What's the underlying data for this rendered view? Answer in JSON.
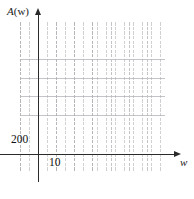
{
  "figure": {
    "name": "blank-coordinate-grid",
    "background_color": "#ffffff",
    "axis_color": "#2a2a2a",
    "major_grid_color": "#c4c4c8",
    "minor_grid_color": "#aaaaaf"
  },
  "axes": {
    "y_label_prefix": "A",
    "y_label_suffix": "(w)",
    "y_label_full": "A(w)",
    "x_label": "w"
  },
  "ticks": {
    "y": [
      {
        "label": "200",
        "value": 200
      }
    ],
    "x": [
      {
        "label": "10",
        "value": 10
      }
    ]
  },
  "chart_data": {
    "type": "line",
    "title": "",
    "subtitle": "",
    "xlabel": "w",
    "ylabel": "A(w)",
    "series": [],
    "x": [],
    "categories": [],
    "values": [],
    "xlim": [
      0,
      80
    ],
    "ylim": [
      -200,
      1400
    ],
    "x_tick_labels": [
      "10"
    ],
    "y_tick_labels": [
      "200"
    ],
    "x_tick_values": [
      10
    ],
    "y_tick_values": [
      200
    ],
    "x_major_step": 10,
    "y_major_step": 200,
    "x_minor_per_major": 4,
    "y_minor_per_major": 4,
    "grid": true,
    "grid_style": "major solid light gray with minor dotted subdivisions",
    "legend": null,
    "legend_position": "none",
    "annotations": [],
    "axis_arrows": true,
    "note": "Empty graph-paper axes; no data curve is plotted."
  }
}
